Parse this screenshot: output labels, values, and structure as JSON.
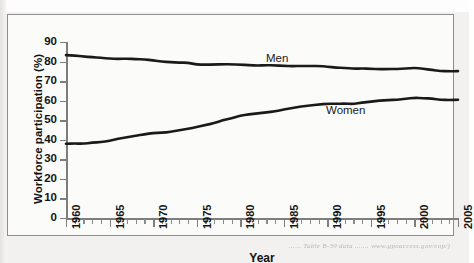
{
  "page": {
    "caption": "...... Table  B-39 data ....... www.gpoaccess.gov/eop/)"
  },
  "figure": {
    "x_axis_title": "Year",
    "y_axis_title": "Workforce participation (%)",
    "series_labels": {
      "men": "Men",
      "women": "Women"
    }
  },
  "chart_data": {
    "type": "line",
    "title": "",
    "xlabel": "Year",
    "ylabel": "Workforce participation (%)",
    "xlim": [
      1960,
      2005
    ],
    "ylim": [
      0,
      90
    ],
    "ytick_labels": [
      "0",
      "10",
      "20",
      "30",
      "40",
      "50",
      "60",
      "70",
      "80",
      "90"
    ],
    "yticks": [
      0,
      10,
      20,
      30,
      40,
      50,
      60,
      70,
      80,
      90
    ],
    "xtick_labels": [
      "1960",
      "1965",
      "1970",
      "1975",
      "1980",
      "1985",
      "1990",
      "1995",
      "2000",
      "2005"
    ],
    "xticks": [
      1960,
      1965,
      1970,
      1975,
      1980,
      1985,
      1990,
      1995,
      2000,
      2005
    ],
    "minor_xtick_interval": 1,
    "grid": false,
    "legend": "inline-labels",
    "x": [
      1960,
      1961,
      1962,
      1963,
      1964,
      1965,
      1966,
      1967,
      1968,
      1969,
      1970,
      1971,
      1972,
      1973,
      1974,
      1975,
      1976,
      1977,
      1978,
      1979,
      1980,
      1981,
      1982,
      1983,
      1984,
      1985,
      1986,
      1987,
      1988,
      1989,
      1990,
      1991,
      1992,
      1993,
      1994,
      1995,
      1996,
      1997,
      1998,
      1999,
      2000,
      2001,
      2002,
      2003,
      2004,
      2005
    ],
    "series": [
      {
        "name": "Men",
        "values": [
          83.3,
          83.0,
          82.6,
          82.2,
          81.9,
          81.5,
          81.3,
          81.5,
          81.2,
          81.1,
          80.6,
          80.0,
          79.7,
          79.5,
          79.4,
          78.5,
          78.4,
          78.5,
          78.6,
          78.6,
          78.4,
          78.2,
          77.9,
          78.2,
          78.0,
          77.8,
          77.6,
          77.8,
          77.7,
          77.8,
          77.4,
          76.9,
          76.8,
          76.3,
          76.5,
          76.3,
          76.1,
          76.2,
          76.2,
          76.4,
          76.8,
          76.3,
          75.7,
          75.2,
          75.0,
          75.1
        ]
      },
      {
        "name": "Women",
        "values": [
          38.0,
          38.1,
          38.0,
          38.5,
          38.8,
          39.5,
          40.5,
          41.3,
          42.0,
          42.8,
          43.5,
          43.6,
          44.0,
          44.9,
          45.6,
          46.5,
          47.5,
          48.5,
          50.0,
          51.0,
          52.3,
          53.0,
          53.5,
          54.0,
          54.5,
          55.5,
          56.3,
          57.0,
          57.5,
          58.0,
          58.5,
          58.4,
          58.5,
          58.3,
          59.0,
          59.5,
          60.0,
          60.3,
          60.5,
          61.0,
          61.5,
          61.3,
          61.0,
          60.5,
          60.3,
          60.5
        ]
      }
    ]
  }
}
